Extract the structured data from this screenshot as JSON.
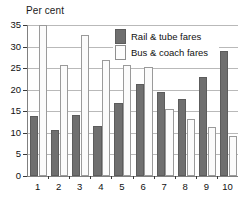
{
  "chart_data": {
    "type": "bar",
    "title": "Per cent",
    "xlabel": "",
    "ylabel": "Per cent",
    "ylim": [
      0,
      35
    ],
    "ytick_labels": [
      "0",
      "5",
      "10",
      "15",
      "20",
      "25",
      "30",
      "35"
    ],
    "ytick_values": [
      0,
      5,
      10,
      15,
      20,
      25,
      30,
      35
    ],
    "grid": true,
    "legend_position": "top-right-inside",
    "categories": [
      "1",
      "2",
      "3",
      "4",
      "5",
      "6",
      "7",
      "8",
      "9",
      "10"
    ],
    "series": [
      {
        "name": "Rail & tube fares",
        "color": "#6f6f6f",
        "values": [
          13.9,
          10.7,
          14.2,
          11.7,
          16.9,
          21.4,
          19.4,
          17.8,
          22.9,
          29.0
        ]
      },
      {
        "name": "Bus & coach fares",
        "color": "#fbfbfb",
        "values": [
          35.0,
          25.8,
          32.8,
          27.0,
          25.8,
          25.3,
          15.6,
          13.2,
          11.4,
          9.3
        ]
      }
    ]
  },
  "legend": {
    "items": [
      {
        "label": "Rail & tube fares",
        "swatch": "rail"
      },
      {
        "label": "Bus & coach fares",
        "swatch": "bus"
      }
    ]
  },
  "colors": {
    "rail_fill": "#6f6f6f",
    "bus_fill": "#fbfbfb",
    "gridline": "#b9b9b9",
    "axis": "#808080",
    "text": "#111111"
  }
}
